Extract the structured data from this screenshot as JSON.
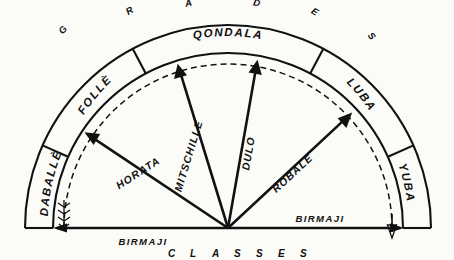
{
  "diagram": {
    "title_top": "GRADES",
    "title_bottom": "CLASSES",
    "top_letters": [
      "G",
      "R",
      "A",
      "D",
      "E",
      "S"
    ],
    "bottom_letters": [
      "C",
      "L",
      "A",
      "S",
      "S",
      "E",
      "S"
    ],
    "ink_color": "#111111",
    "background_color": "#fbfbf8"
  },
  "grades": [
    {
      "label": "DABALLÈ",
      "start_deg": 180,
      "end_deg": 156
    },
    {
      "label": "FOLLÈ",
      "start_deg": 156,
      "end_deg": 118
    },
    {
      "label": "QONDALA",
      "start_deg": 118,
      "end_deg": 62
    },
    {
      "label": "LUBA",
      "start_deg": 62,
      "end_deg": 24
    },
    {
      "label": "YUBA",
      "start_deg": 24,
      "end_deg": 0
    }
  ],
  "classes": [
    {
      "label": "BIRMAJI",
      "angle_deg": 180
    },
    {
      "label": "HORATA",
      "angle_deg": 146
    },
    {
      "label": "MITSCHILLE",
      "angle_deg": 107
    },
    {
      "label": "DULO",
      "angle_deg": 80
    },
    {
      "label": "ROBALE",
      "angle_deg": 43
    },
    {
      "label": "BIRMAJI",
      "angle_deg": 0
    }
  ],
  "geometry": {
    "center_x": 228,
    "center_y": 228,
    "outer_radius": 203,
    "inner_radius": 175,
    "dashed_radius": 164
  }
}
